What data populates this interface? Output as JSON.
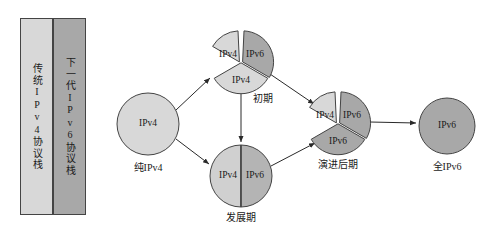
{
  "diagram": {
    "colors": {
      "ipv4_fill": "#d8d8d8",
      "ipv6_fill": "#a8a8a8",
      "stroke": "#444444",
      "background": "#ffffff",
      "text": "#1a1a1a"
    }
  },
  "legend": {
    "box": {
      "x": 20,
      "y": 18,
      "width": 66,
      "height": 197
    },
    "columns": [
      {
        "id": "legacy-ipv4",
        "label": "传统IPv4协议栈",
        "fill": "#d8d8d8"
      },
      {
        "id": "next-gen-ipv6",
        "label": "下一代IPv6协议栈",
        "fill": "#a8a8a8"
      }
    ]
  },
  "nodes": [
    {
      "id": "pure-ipv4",
      "caption": "纯IPv4",
      "cx": 148,
      "cy": 124,
      "r": 31,
      "type": "solid",
      "segments": [
        {
          "label": "IPv4",
          "fill": "#d8d8d8"
        }
      ]
    },
    {
      "id": "early-stage",
      "caption": "初期",
      "cx": 241,
      "cy": 61,
      "r": 31,
      "type": "three-sector",
      "segments": [
        {
          "label": "IPv4",
          "fill": "#d8d8d8",
          "position": "top-left"
        },
        {
          "label": "IPv6",
          "fill": "#a8a8a8",
          "position": "top-right"
        },
        {
          "label": "IPv4",
          "fill": "#d8d8d8",
          "position": "bottom"
        }
      ]
    },
    {
      "id": "growth-stage",
      "caption": "发展期",
      "cx": 241,
      "cy": 176,
      "r": 31,
      "type": "half-split",
      "segments": [
        {
          "label": "IPv4",
          "fill": "#d0d0d0",
          "position": "left"
        },
        {
          "label": "IPv6",
          "fill": "#b4b4b4",
          "position": "right"
        }
      ]
    },
    {
      "id": "late-evolution",
      "caption": "演进后期",
      "cx": 338,
      "cy": 122,
      "r": 31,
      "type": "three-sector",
      "segments": [
        {
          "label": "IPv4",
          "fill": "#d8d8d8",
          "position": "top-left"
        },
        {
          "label": "IPv6",
          "fill": "#a8a8a8",
          "position": "top-right"
        },
        {
          "label": "IPv6",
          "fill": "#a8a8a8",
          "position": "bottom"
        }
      ]
    },
    {
      "id": "full-ipv6",
      "caption": "全IPv6",
      "cx": 447,
      "cy": 126,
      "r": 28,
      "type": "solid",
      "segments": [
        {
          "label": "IPv6",
          "fill": "#a8a8a8"
        }
      ]
    }
  ],
  "edges": [
    {
      "id": "pure-to-early",
      "from": "pure-ipv4",
      "to": "early-stage"
    },
    {
      "id": "pure-to-growth",
      "from": "pure-ipv4",
      "to": "growth-stage"
    },
    {
      "id": "early-to-growth",
      "from": "early-stage",
      "to": "growth-stage"
    },
    {
      "id": "early-to-late",
      "from": "early-stage",
      "to": "late-evolution"
    },
    {
      "id": "growth-to-late",
      "from": "growth-stage",
      "to": "late-evolution"
    },
    {
      "id": "late-to-full",
      "from": "late-evolution",
      "to": "full-ipv6"
    }
  ],
  "node_texts": {
    "pure_ipv4_seg0": "IPv4",
    "pure_ipv4_caption": "纯IPv4",
    "early_seg0": "IPv4",
    "early_seg1": "IPv6",
    "early_seg2": "IPv4",
    "early_caption": "初期",
    "growth_seg0": "IPv4",
    "growth_seg1": "IPv6",
    "growth_caption": "发展期",
    "late_seg0": "IPv4",
    "late_seg1": "IPv6",
    "late_seg2": "IPv6",
    "late_caption": "演进后期",
    "full_seg0": "IPv6",
    "full_caption": "全IPv6"
  }
}
